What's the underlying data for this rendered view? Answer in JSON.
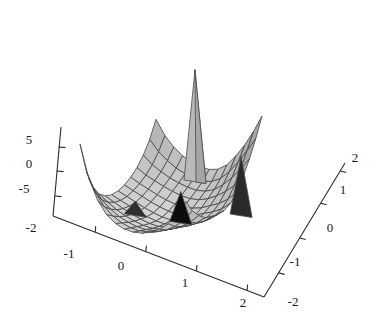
{
  "figure": {
    "kind": "surface-plot-3d",
    "background_color": "#ffffff",
    "has_title": false,
    "has_legend": false,
    "has_frame_box": false
  },
  "chart_data": {
    "type": "surface",
    "title": "",
    "subtitle": "",
    "xlabel": "",
    "ylabel": "",
    "zlabel": "",
    "grid": true,
    "legend_position": "none",
    "projection": "wireframe-mesh-3d",
    "x": [
      -2,
      -1.6667,
      -1.3333,
      -1,
      -0.6667,
      -0.3333,
      0,
      0.3333,
      0.6667,
      1,
      1.3333,
      1.6667,
      2
    ],
    "y": [
      -2,
      -1.6667,
      -1.3333,
      -1,
      -0.6667,
      -0.3333,
      0,
      0.3333,
      0.6667,
      1,
      1.3333,
      1.6667,
      2
    ],
    "xlim": [
      -2,
      2
    ],
    "ylim": [
      -2,
      2
    ],
    "zlim": [
      -9,
      9
    ],
    "xticks": [
      -2,
      -1,
      0,
      1,
      2
    ],
    "yticks": [
      -2,
      -1,
      0,
      1,
      2
    ],
    "zticks": [
      -5,
      0,
      5
    ],
    "xtick_labels": [
      "-2",
      "-1",
      "0",
      "1",
      "2"
    ],
    "ytick_labels": [
      "-2",
      "-1",
      "0",
      "1",
      "2"
    ],
    "ztick_labels": [
      "5",
      "0",
      "-5"
    ],
    "mesh_rows": 13,
    "mesh_cols": 13,
    "surface_fill": "#cfcfcf",
    "surface_fill_dark": "#8d8d8d",
    "surface_fill_spike": "#111111",
    "mesh_line_color": "#4a4a4a",
    "z_values": [
      [
        8.9,
        4.2,
        1.4,
        -0.2,
        -1.0,
        -1.3,
        -1.2,
        -0.8,
        -0.1,
        0.9,
        2.3,
        4.2,
        6.8
      ],
      [
        4.2,
        1.6,
        0.0,
        -0.9,
        -1.4,
        -1.6,
        -1.5,
        -1.1,
        -0.5,
        0.3,
        1.4,
        2.9,
        4.9
      ],
      [
        1.4,
        0.0,
        -0.9,
        -1.5,
        -1.8,
        -1.9,
        -1.8,
        -1.4,
        -0.8,
        0.0,
        0.9,
        2.1,
        3.7
      ],
      [
        -0.2,
        -0.9,
        -1.5,
        -1.9,
        -2.1,
        -2.2,
        -2.1,
        -1.7,
        -1.1,
        -0.3,
        0.5,
        1.5,
        2.9
      ],
      [
        -1.0,
        -1.4,
        -1.8,
        -2.1,
        -2.3,
        -2.4,
        -2.3,
        -1.9,
        -1.3,
        -0.5,
        0.3,
        1.2,
        2.5
      ],
      [
        -1.3,
        -1.6,
        -1.9,
        -2.2,
        -2.4,
        -2.5,
        -2.4,
        -2.0,
        -1.4,
        -0.6,
        0.2,
        1.1,
        2.4
      ],
      [
        -1.2,
        -1.5,
        -1.8,
        -2.1,
        -2.3,
        -2.4,
        -2.3,
        -1.9,
        -1.3,
        -0.5,
        0.3,
        1.2,
        2.5
      ],
      [
        -0.8,
        -1.1,
        -1.4,
        -1.7,
        -1.9,
        -2.0,
        -1.9,
        -1.5,
        -0.9,
        -0.1,
        0.7,
        1.7,
        3.1
      ],
      [
        -0.1,
        -0.5,
        -0.8,
        -1.1,
        -1.3,
        -1.4,
        -1.3,
        -0.9,
        -0.3,
        0.6,
        1.5,
        2.7,
        4.3
      ],
      [
        0.9,
        0.3,
        0.0,
        -0.3,
        -0.5,
        -0.6,
        -0.5,
        -0.1,
        0.6,
        1.6,
        2.8,
        4.3,
        6.2
      ],
      [
        2.3,
        1.4,
        0.9,
        0.5,
        0.3,
        0.2,
        0.3,
        0.7,
        1.5,
        2.8,
        4.4,
        6.3,
        8.4
      ],
      [
        4.2,
        2.9,
        2.1,
        1.5,
        1.2,
        1.1,
        1.2,
        1.7,
        2.7,
        4.3,
        6.3,
        8.6,
        11.0
      ],
      [
        6.8,
        4.9,
        3.7,
        2.9,
        2.5,
        2.4,
        2.5,
        3.1,
        4.3,
        6.2,
        8.4,
        11.0,
        14.0
      ]
    ],
    "spikes": [
      {
        "name": "back-center-spike",
        "x": -0.35,
        "y": 1.75,
        "z": 17.5,
        "color": "#b9b9b9",
        "note": "tall light spike rising at back of surface"
      },
      {
        "name": "right-corner-spike",
        "x": 2.0,
        "y": 0.9,
        "z": 9.5,
        "color": "#2a2a2a",
        "note": "dark spike at right corner"
      },
      {
        "name": "front-center-spike",
        "x": 1.05,
        "y": -0.95,
        "z": 5.2,
        "color": "#0d0d0d",
        "note": "black spike in foreground"
      },
      {
        "name": "front-left-spike",
        "x": -0.2,
        "y": -1.6,
        "z": 2.6,
        "color": "#2f2f2f",
        "note": "small dark wedge in lower-left trough"
      }
    ],
    "annotations": []
  },
  "axes": {
    "z_axis": {
      "name": "z-axis",
      "ticks": [
        {
          "label": "5",
          "x": 29,
          "y": 144
        },
        {
          "label": "0",
          "x": 29,
          "y": 168
        },
        {
          "label": "-5",
          "x": 24,
          "y": 193
        }
      ]
    },
    "x_axis": {
      "name": "x-axis-front-left",
      "ticks": [
        {
          "label": "-2",
          "x": 31,
          "y": 232
        },
        {
          "label": "-1",
          "x": 69,
          "y": 258
        },
        {
          "label": "0",
          "x": 121,
          "y": 270
        },
        {
          "label": "1",
          "x": 185,
          "y": 287
        },
        {
          "label": "2",
          "x": 243,
          "y": 307
        }
      ]
    },
    "y_axis": {
      "name": "y-axis-front-right",
      "ticks": [
        {
          "label": "-2",
          "x": 293,
          "y": 306
        },
        {
          "label": "-1",
          "x": 295,
          "y": 266
        },
        {
          "label": "0",
          "x": 330,
          "y": 232
        },
        {
          "label": "1",
          "x": 343,
          "y": 194
        },
        {
          "label": "2",
          "x": 355,
          "y": 162
        }
      ]
    }
  }
}
